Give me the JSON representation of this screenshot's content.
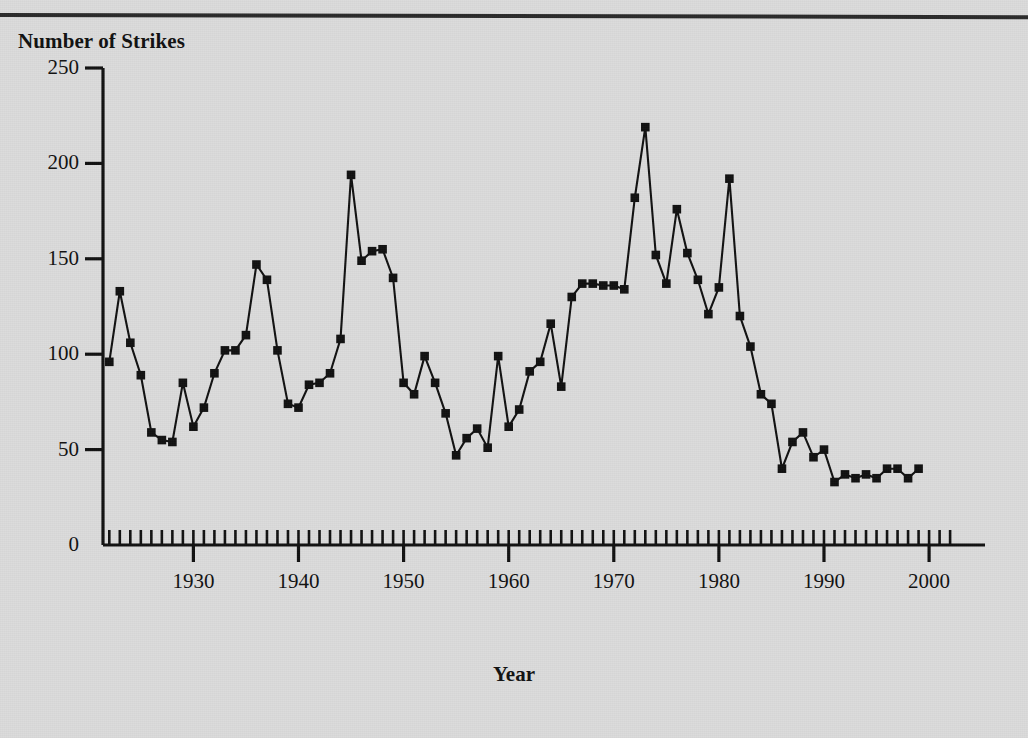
{
  "figure": {
    "y_axis_title": "Number of Strikes",
    "x_axis_title": "Year"
  },
  "colors": {
    "background": "#dcdcdc",
    "ink": "#111111",
    "rule": "#2b2b2b"
  },
  "chart_data": {
    "type": "line",
    "title": "",
    "subtitle": "",
    "xlabel": "Year",
    "ylabel": "Number of Strikes",
    "xlim": [
      1921,
      2003
    ],
    "ylim": [
      0,
      250
    ],
    "yticks": [
      0,
      50,
      100,
      150,
      200,
      250
    ],
    "xticks": [
      1930,
      1940,
      1950,
      1960,
      1970,
      1980,
      1990,
      2000
    ],
    "x_minor_tick_interval": 1,
    "grid": false,
    "legend": null,
    "marker": "square",
    "x": [
      1922,
      1923,
      1924,
      1925,
      1926,
      1927,
      1928,
      1929,
      1930,
      1931,
      1932,
      1933,
      1934,
      1935,
      1936,
      1937,
      1938,
      1939,
      1940,
      1941,
      1942,
      1943,
      1944,
      1945,
      1946,
      1947,
      1948,
      1949,
      1950,
      1951,
      1952,
      1953,
      1954,
      1955,
      1956,
      1957,
      1958,
      1959,
      1960,
      1961,
      1962,
      1963,
      1964,
      1965,
      1966,
      1967,
      1968,
      1969,
      1970,
      1971,
      1972,
      1973,
      1974,
      1975,
      1976,
      1977,
      1978,
      1979,
      1980,
      1981,
      1982,
      1983,
      1984,
      1985,
      1986,
      1987,
      1988,
      1989,
      1990,
      1991,
      1992,
      1993,
      1994,
      1995,
      1996,
      1997,
      1998,
      1999
    ],
    "values": [
      96,
      133,
      106,
      89,
      59,
      55,
      54,
      85,
      62,
      72,
      90,
      102,
      102,
      110,
      147,
      139,
      102,
      74,
      72,
      84,
      85,
      90,
      108,
      194,
      149,
      154,
      155,
      140,
      85,
      79,
      99,
      85,
      69,
      47,
      56,
      61,
      51,
      99,
      62,
      71,
      91,
      96,
      116,
      83,
      130,
      137,
      137,
      136,
      136,
      134,
      182,
      219,
      152,
      137,
      176,
      153,
      139,
      121,
      135,
      192,
      120,
      104,
      79,
      74,
      40,
      54,
      59,
      46,
      50,
      33,
      37,
      35,
      37,
      35,
      40,
      40,
      35,
      40
    ]
  }
}
